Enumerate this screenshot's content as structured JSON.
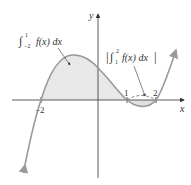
{
  "figure": {
    "axes": {
      "x_label": "x",
      "y_label": "y",
      "tick_labels": [
        "−2",
        "1",
        "2"
      ],
      "tick_values": [
        -2,
        1,
        2
      ]
    },
    "function": {
      "name": "f(x)",
      "form": "k(x+2)(x-1)(x-2)",
      "roots": [
        -2,
        1,
        2
      ]
    },
    "annotations": [
      {
        "id": "left-integral",
        "int_lower": "−2",
        "int_upper": "1",
        "integrand": "f(x) dx",
        "region": "x from -2 to 1, above x-axis"
      },
      {
        "id": "right-integral",
        "int_lower": "1",
        "int_upper": "2",
        "integrand": "f(x) dx",
        "absolute_value": true,
        "region": "x from 1 to 2, below x-axis"
      }
    ],
    "colors": {
      "curve": "#9a9a9a",
      "fill": "#e6e6e6",
      "axes": "#333333",
      "text": "#333333"
    }
  }
}
